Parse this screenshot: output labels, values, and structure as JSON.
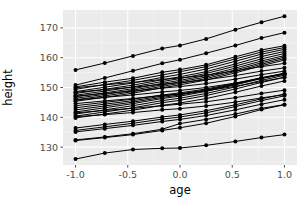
{
  "chart_data": {
    "type": "line",
    "title": "",
    "subtitle": "",
    "xlabel": "age",
    "ylabel": "height",
    "xlim": [
      -1.12,
      1.12
    ],
    "ylim": [
      124.0,
      176.0
    ],
    "xticks": [
      -1.0,
      -0.5,
      0.0,
      0.5,
      1.0
    ],
    "xtick_labels": [
      "-1.0",
      "-0.5",
      "0.0",
      "0.5",
      "1.0"
    ],
    "yticks": [
      130,
      140,
      150,
      160,
      170
    ],
    "ytick_labels": [
      "130",
      "140",
      "150",
      "160",
      "170"
    ],
    "grid": true,
    "grid_major_color": "#ffffff",
    "grid_minor_color": "#f4f4f4",
    "panel_background": "#ebebeb",
    "plot_background": "#ffffff",
    "line_color": "#000000",
    "point_color": "#000000",
    "line_width": 1.0,
    "point_size": 2.0,
    "legend": "none",
    "legend_position": "none",
    "x": [
      -1.0,
      -0.72,
      -0.45,
      -0.17,
      0.0,
      0.25,
      0.53,
      0.78,
      1.0
    ],
    "series": [
      {
        "name": "s01",
        "values": [
          155.9,
          158.2,
          160.6,
          163.1,
          164.1,
          166.3,
          169.4,
          171.9,
          173.9
        ]
      },
      {
        "name": "s02",
        "values": [
          150.8,
          153.2,
          155.6,
          158.1,
          159.3,
          161.5,
          164.1,
          166.6,
          168.4
        ]
      },
      {
        "name": "s03",
        "values": [
          150.2,
          151.8,
          153.1,
          155.1,
          156.0,
          157.6,
          160.3,
          162.6,
          164.0
        ]
      },
      {
        "name": "s04",
        "values": [
          149.4,
          151.0,
          152.4,
          154.2,
          155.3,
          157.0,
          159.6,
          161.9,
          163.4
        ]
      },
      {
        "name": "s05",
        "values": [
          148.6,
          150.1,
          151.5,
          153.4,
          154.4,
          156.2,
          158.8,
          161.2,
          162.8
        ]
      },
      {
        "name": "s06",
        "values": [
          148.0,
          149.4,
          150.8,
          152.6,
          153.6,
          155.3,
          157.9,
          160.4,
          162.1
        ]
      },
      {
        "name": "s07",
        "values": [
          147.4,
          148.8,
          150.2,
          152.0,
          153.0,
          154.7,
          157.2,
          159.6,
          161.4
        ]
      },
      {
        "name": "s08",
        "values": [
          146.9,
          148.2,
          149.6,
          151.4,
          152.4,
          154.0,
          156.5,
          158.9,
          160.7
        ]
      },
      {
        "name": "s09",
        "values": [
          146.4,
          147.7,
          149.1,
          150.9,
          151.9,
          153.5,
          155.9,
          158.3,
          160.2
        ]
      },
      {
        "name": "s10",
        "values": [
          145.9,
          147.2,
          148.6,
          150.4,
          151.4,
          153.0,
          155.4,
          157.8,
          159.7
        ]
      },
      {
        "name": "s11",
        "values": [
          145.4,
          146.7,
          148.1,
          149.9,
          150.9,
          152.5,
          154.9,
          157.3,
          159.2
        ]
      },
      {
        "name": "s12",
        "values": [
          149.9,
          150.9,
          151.7,
          152.7,
          153.2,
          154.1,
          155.6,
          157.0,
          158.1
        ]
      },
      {
        "name": "s13",
        "values": [
          148.4,
          149.3,
          150.1,
          151.1,
          151.6,
          152.6,
          154.0,
          155.5,
          156.6
        ]
      },
      {
        "name": "s14",
        "values": [
          147.1,
          148.0,
          148.8,
          149.8,
          150.3,
          151.3,
          152.8,
          154.3,
          155.5
        ]
      },
      {
        "name": "s15",
        "values": [
          145.8,
          146.7,
          147.5,
          148.5,
          149.0,
          150.0,
          151.5,
          153.1,
          154.4
        ]
      },
      {
        "name": "s16",
        "values": [
          144.6,
          145.5,
          146.3,
          147.3,
          147.9,
          148.9,
          150.4,
          152.0,
          153.4
        ]
      },
      {
        "name": "s17",
        "values": [
          143.9,
          145.0,
          146.1,
          147.5,
          148.2,
          149.5,
          151.4,
          153.3,
          154.7
        ]
      },
      {
        "name": "s18",
        "values": [
          143.2,
          144.4,
          145.6,
          147.1,
          147.8,
          149.2,
          151.2,
          153.1,
          154.6
        ]
      },
      {
        "name": "s19",
        "values": [
          142.5,
          143.8,
          145.1,
          146.7,
          147.5,
          149.0,
          151.1,
          153.2,
          154.8
        ]
      },
      {
        "name": "s20",
        "values": [
          141.8,
          143.2,
          144.6,
          146.3,
          147.1,
          148.7,
          150.9,
          153.0,
          154.7
        ]
      },
      {
        "name": "s21",
        "values": [
          141.1,
          142.5,
          143.9,
          145.6,
          146.4,
          148.0,
          150.2,
          152.4,
          154.1
        ]
      },
      {
        "name": "s22",
        "values": [
          140.4,
          141.8,
          143.2,
          144.9,
          145.7,
          147.3,
          149.5,
          151.7,
          153.4
        ]
      },
      {
        "name": "s23",
        "values": [
          139.8,
          141.1,
          142.4,
          144.0,
          144.8,
          146.3,
          148.4,
          150.5,
          152.2
        ]
      },
      {
        "name": "s24",
        "values": [
          141.5,
          142.3,
          143.0,
          143.9,
          144.4,
          145.2,
          146.6,
          148.0,
          149.1
        ]
      },
      {
        "name": "s25",
        "values": [
          140.2,
          140.9,
          141.6,
          142.5,
          142.9,
          143.8,
          145.1,
          146.5,
          147.6
        ]
      },
      {
        "name": "s26",
        "values": [
          136.4,
          137.6,
          138.7,
          140.1,
          140.8,
          142.2,
          144.2,
          146.2,
          147.8
        ]
      },
      {
        "name": "s27",
        "values": [
          135.6,
          136.8,
          138.0,
          139.4,
          140.1,
          141.5,
          143.6,
          145.6,
          147.2
        ]
      },
      {
        "name": "s28",
        "values": [
          135.1,
          136.2,
          137.3,
          138.6,
          139.3,
          140.6,
          142.5,
          144.4,
          145.9
        ]
      },
      {
        "name": "s29",
        "values": [
          132.4,
          133.4,
          134.5,
          136.0,
          137.9,
          139.3,
          141.1,
          143.0,
          144.3
        ]
      },
      {
        "name": "s30",
        "values": [
          132.2,
          133.2,
          134.2,
          135.6,
          136.5,
          138.0,
          140.3,
          142.6,
          144.2
        ]
      },
      {
        "name": "s31",
        "values": [
          126.0,
          128.0,
          129.2,
          129.6,
          129.7,
          130.6,
          131.9,
          133.2,
          134.2
        ]
      }
    ]
  }
}
